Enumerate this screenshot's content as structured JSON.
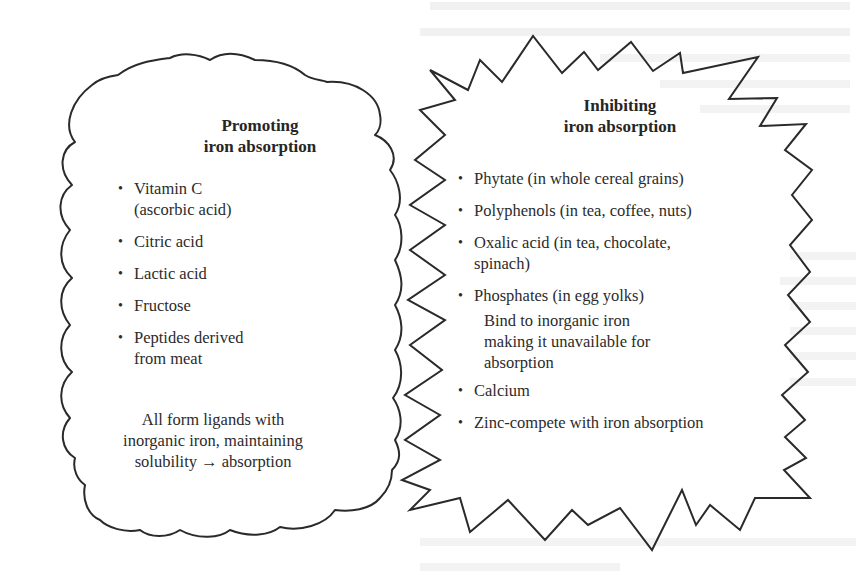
{
  "diagram": {
    "type": "two-panel comparison",
    "promoting": {
      "shape": "cloud",
      "title_line1": "Promoting",
      "title_line2": "iron absorption",
      "items": [
        {
          "line1": "Vitamin C",
          "line2": "(ascorbic acid)"
        },
        {
          "line1": "Citric acid"
        },
        {
          "line1": "Lactic acid"
        },
        {
          "line1": "Fructose"
        },
        {
          "line1": "Peptides derived",
          "line2": "from meat"
        }
      ],
      "note_line1": "All form ligands with",
      "note_line2": "inorganic iron, maintaining",
      "note_line3": "solubility → absorption"
    },
    "inhibiting": {
      "shape": "starburst",
      "title_line1": "Inhibiting",
      "title_line2": "iron absorption",
      "items": [
        {
          "line1": "Phytate (in whole cereal grains)"
        },
        {
          "line1": "Polyphenols (in tea, coffee, nuts)"
        },
        {
          "line1": "Oxalic acid (in tea, chocolate,",
          "line2": "spinach)"
        },
        {
          "line1": "Phosphates (in egg yolks)"
        }
      ],
      "note_line1": "Bind to inorganic iron",
      "note_line2": "making it unavailable for",
      "note_line3": "absorption",
      "items_after_note": [
        {
          "line1": "Calcium"
        },
        {
          "line1": "Zinc-compete with iron absorption"
        }
      ]
    },
    "bullet": "•",
    "colors": {
      "outline": "#2a2a2a",
      "text": "#2b2b2b",
      "bleed_through_text": "#e9e9e9",
      "background": "#ffffff"
    }
  }
}
